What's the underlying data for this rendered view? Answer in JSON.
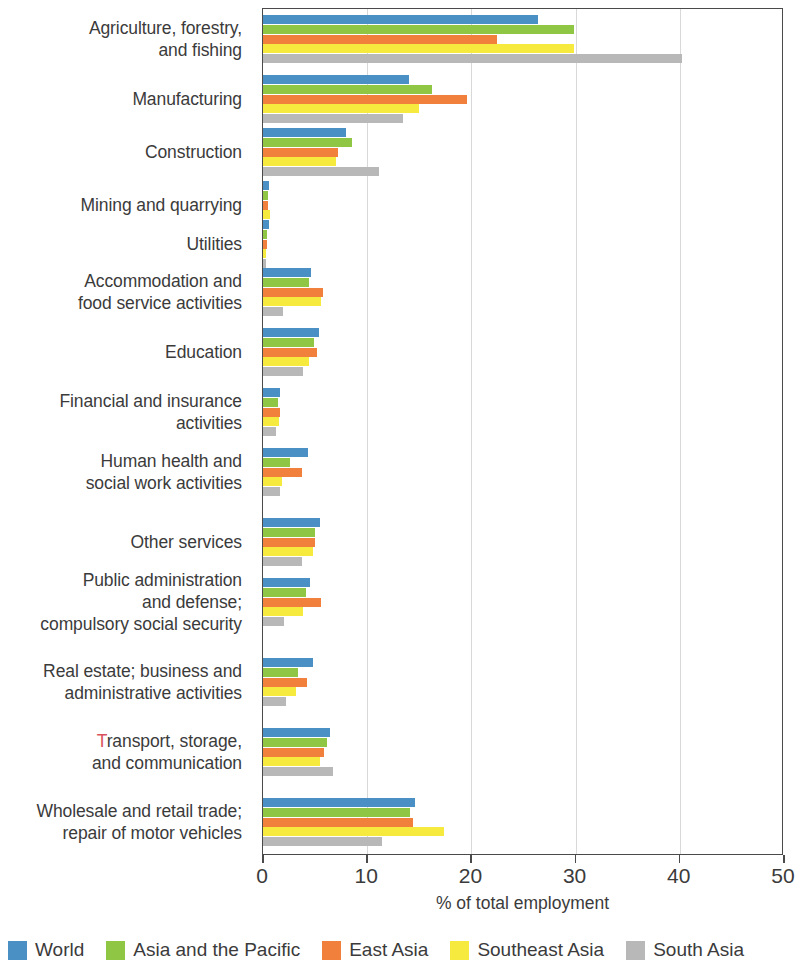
{
  "chart_data": {
    "type": "bar",
    "orientation": "horizontal",
    "title": "",
    "xlabel": "% of total employment",
    "ylabel": "",
    "xlim": [
      0,
      50
    ],
    "xticks": [
      0,
      10,
      20,
      30,
      40,
      50
    ],
    "xtick_labels": [
      "0",
      "10",
      "20",
      "30",
      "40",
      "50"
    ],
    "grid": "vertical",
    "legend_position": "bottom",
    "categories": [
      "Agriculture, forestry, and fishing",
      "Manufacturing",
      "Construction",
      "Mining and quarrying",
      "Utilities",
      "Accommodation and food service activities",
      "Education",
      "Financial and insurance activities",
      "Human health and social work activities",
      "Other services",
      "Public administration and defense; compulsory social security",
      "Real estate; business and administrative activities",
      "Transport, storage, and communication",
      "Wholesale and retail trade; repair of motor vehicles"
    ],
    "series": [
      {
        "name": "World",
        "color": "#4a90c4",
        "values": [
          26.4,
          14.0,
          8.0,
          0.6,
          0.6,
          4.6,
          5.4,
          1.6,
          4.3,
          5.5,
          4.5,
          4.8,
          6.4,
          14.6
        ]
      },
      {
        "name": "Asia and the Pacific",
        "color": "#8fc744",
        "values": [
          29.8,
          16.2,
          8.5,
          0.5,
          0.4,
          4.4,
          4.9,
          1.4,
          2.6,
          5.0,
          4.1,
          3.4,
          6.1,
          14.1
        ]
      },
      {
        "name": "East Asia",
        "color": "#f0803c",
        "values": [
          22.5,
          19.6,
          7.2,
          0.5,
          0.4,
          5.8,
          5.2,
          1.6,
          3.7,
          5.0,
          5.6,
          4.2,
          5.9,
          14.4
        ]
      },
      {
        "name": "Southeast Asia",
        "color": "#f7ea3f",
        "values": [
          29.8,
          15.0,
          7.0,
          0.7,
          0.3,
          5.6,
          4.4,
          1.5,
          1.8,
          4.8,
          3.8,
          3.2,
          5.5,
          17.4
        ]
      },
      {
        "name": "South Asia",
        "color": "#b8b8b8",
        "values": [
          40.2,
          13.4,
          11.1,
          0.4,
          0.3,
          1.9,
          3.8,
          1.2,
          1.6,
          3.7,
          2.0,
          2.2,
          6.7,
          11.4
        ]
      }
    ]
  },
  "ylabel_lines": [
    [
      "Agriculture, forestry,",
      "and fishing"
    ],
    [
      "Manufacturing"
    ],
    [
      "Construction"
    ],
    [
      "Mining and quarrying"
    ],
    [
      "Utilities"
    ],
    [
      "Accommodation and",
      "food service activities"
    ],
    [
      "Education"
    ],
    [
      "Financial and insurance",
      "activities"
    ],
    [
      "Human health and",
      "social work activities"
    ],
    [
      "Other services"
    ],
    [
      "Public administration",
      "and defense;",
      "compulsory social security"
    ],
    [
      "Real estate; business and",
      "administrative activities"
    ],
    [
      "Transport, storage,",
      "and communication"
    ],
    [
      "Wholesale and retail trade;",
      "repair of motor vehicles"
    ]
  ],
  "ylabel_red_initial_index": 12,
  "axis": {
    "x_title": "% of total employment"
  },
  "legend": {
    "items": [
      {
        "label": "World",
        "color": "#4a90c4"
      },
      {
        "label": "Asia and the Pacific",
        "color": "#8fc744"
      },
      {
        "label": "East Asia",
        "color": "#f0803c"
      },
      {
        "label": "Southeast Asia",
        "color": "#f7ea3f"
      },
      {
        "label": "South Asia",
        "color": "#b8b8b8"
      }
    ]
  }
}
